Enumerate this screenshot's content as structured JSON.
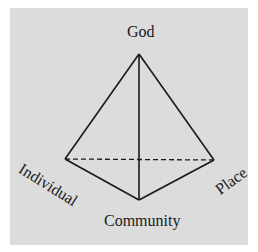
{
  "diagram": {
    "type": "tetrahedron",
    "vertices": {
      "top": {
        "label": "God"
      },
      "left": {
        "label": "Individual"
      },
      "right": {
        "label": "Place"
      },
      "bottom": {
        "label": "Community"
      }
    },
    "edges": [
      {
        "from": "God",
        "to": "Individual",
        "style": "solid"
      },
      {
        "from": "God",
        "to": "Place",
        "style": "solid"
      },
      {
        "from": "God",
        "to": "Community",
        "style": "solid"
      },
      {
        "from": "Individual",
        "to": "Community",
        "style": "solid"
      },
      {
        "from": "Community",
        "to": "Place",
        "style": "solid"
      },
      {
        "from": "Individual",
        "to": "Place",
        "style": "dashed"
      }
    ],
    "colors": {
      "background": "#dcdcdc",
      "line": "#1a1a1a"
    }
  }
}
